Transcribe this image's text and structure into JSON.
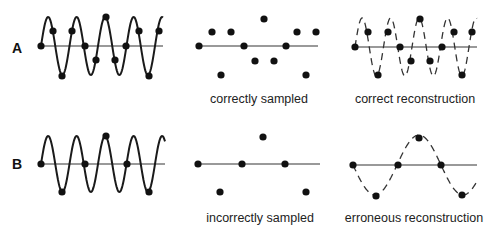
{
  "rows": [
    {
      "label": "A",
      "captions": {
        "sampled": "correctly sampled",
        "reconstruction": "correct reconstruction"
      }
    },
    {
      "label": "B",
      "captions": {
        "sampled": "incorrectly sampled",
        "reconstruction": "erroneous reconstruction"
      }
    }
  ],
  "colors": {
    "signal": "#1a1a1a",
    "axis": "#777777",
    "dot": "#111111",
    "text": "#222222"
  },
  "panels": {
    "A": {
      "axis_y": 46,
      "signal": {
        "x0": 41,
        "x1": 163,
        "period": 28.5,
        "amp": 29
      },
      "samples_signal": [
        [
          41,
          46
        ],
        [
          53,
          31
        ],
        [
          62,
          76
        ],
        [
          72,
          31
        ],
        [
          85,
          46
        ],
        [
          96,
          60
        ],
        [
          106,
          17
        ],
        [
          115,
          60
        ],
        [
          126,
          46
        ],
        [
          139,
          31
        ],
        [
          149,
          76
        ],
        [
          159,
          31
        ]
      ],
      "samples_only": [
        [
          199,
          46
        ],
        [
          212,
          32
        ],
        [
          221,
          75
        ],
        [
          231,
          32
        ],
        [
          244,
          46
        ],
        [
          255,
          61
        ],
        [
          264,
          19
        ],
        [
          274,
          61
        ],
        [
          286,
          46
        ],
        [
          297,
          32
        ],
        [
          306,
          75
        ],
        [
          316,
          32
        ]
      ],
      "samples_recon": [
        [
          355,
          47
        ],
        [
          368,
          32
        ],
        [
          378,
          75
        ],
        [
          388,
          32
        ],
        [
          400,
          47
        ],
        [
          411,
          61
        ],
        [
          420,
          19
        ],
        [
          430,
          61
        ],
        [
          442,
          47
        ],
        [
          454,
          32
        ],
        [
          462,
          75
        ],
        [
          472,
          32
        ]
      ]
    },
    "B": {
      "axis_y": 164,
      "samples_signal": [
        [
          41,
          164
        ],
        [
          62,
          192
        ],
        [
          85,
          164
        ],
        [
          106,
          136
        ],
        [
          127,
          164
        ],
        [
          149,
          192
        ]
      ],
      "samples_only": [
        [
          198,
          164
        ],
        [
          220,
          192
        ],
        [
          242,
          164
        ],
        [
          263,
          137
        ],
        [
          285,
          164
        ],
        [
          306,
          192
        ]
      ],
      "samples_recon": [
        [
          353,
          165
        ],
        [
          376,
          196
        ],
        [
          398,
          165
        ],
        [
          419,
          138
        ],
        [
          441,
          165
        ],
        [
          462,
          195
        ]
      ]
    }
  }
}
